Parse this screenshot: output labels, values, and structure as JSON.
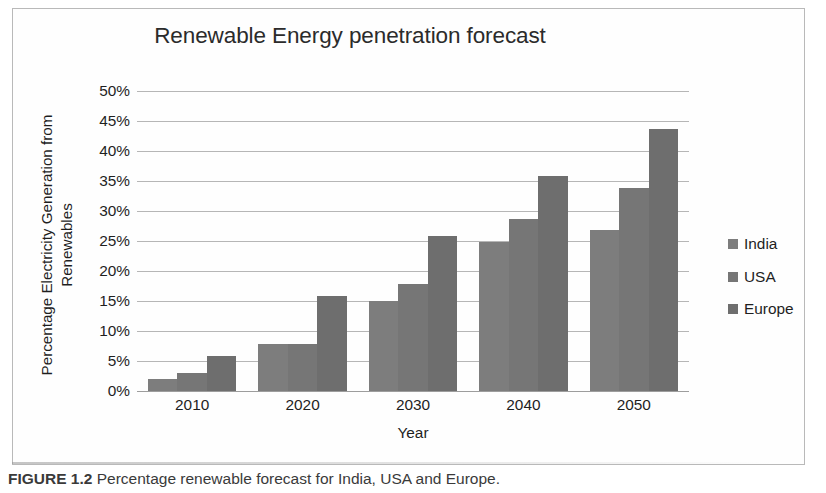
{
  "figure": {
    "caption_number": "FIGURE 1.2",
    "caption_text": "Percentage renewable forecast for India, USA and Europe."
  },
  "chart_data": {
    "type": "bar",
    "title": "Renewable Energy penetration forecast",
    "xlabel": "Year",
    "ylabel": "Percentage Electricity Generation from Renewables",
    "categories": [
      "2010",
      "2020",
      "2030",
      "2040",
      "2050"
    ],
    "series": [
      {
        "name": "India",
        "values": [
          2.0,
          7.8,
          15.0,
          24.8,
          26.8
        ]
      },
      {
        "name": "USA",
        "values": [
          3.0,
          7.8,
          17.9,
          28.7,
          33.8
        ]
      },
      {
        "name": "Europe",
        "values": [
          5.9,
          15.9,
          25.8,
          35.8,
          43.7
        ]
      }
    ],
    "ylim": [
      0,
      50
    ],
    "ytick_step": 5,
    "ytick_labels": [
      "50%",
      "45%",
      "40%",
      "35%",
      "30%",
      "25%",
      "20%",
      "15%",
      "10%",
      "5%",
      "0%"
    ],
    "ytick_values": [
      50,
      45,
      40,
      35,
      30,
      25,
      20,
      15,
      10,
      5,
      0
    ],
    "grid": true,
    "legend_position": "right",
    "colors": {
      "India": "#7d7d7d",
      "USA": "#767676",
      "Europe": "#6e6e6e",
      "gridline": "#9a9a9a",
      "text": "#1f1f1f"
    }
  },
  "y_axis_title_lines": [
    "Percentage Electricity Generation from",
    "Renewables"
  ]
}
